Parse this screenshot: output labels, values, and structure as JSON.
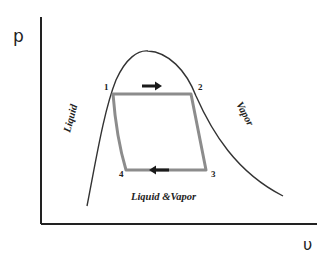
{
  "diagram": {
    "axes": {
      "y_label": "p",
      "x_label": "υ"
    },
    "points": [
      {
        "id": "1",
        "label": "1"
      },
      {
        "id": "2",
        "label": "2"
      },
      {
        "id": "3",
        "label": "3"
      },
      {
        "id": "4",
        "label": "4"
      }
    ],
    "regions": {
      "liquid": "Liquid",
      "vapor": "Vapor",
      "mixture": "Liquid &Vapor"
    },
    "colors": {
      "axis": "#222222",
      "dome": "#333333",
      "cycle": "#8c8c8c",
      "arrow": "#1a1a1a"
    }
  }
}
